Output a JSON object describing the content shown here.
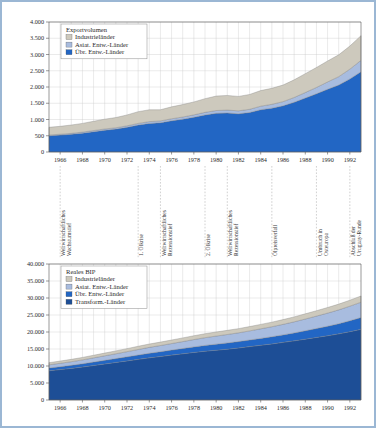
{
  "figure": {
    "background_color": "#ffffff",
    "frame_color": "#9bb7d4"
  },
  "palette": {
    "industrielaender": "#cdc9bd",
    "asiat_entw": "#a8bcdf",
    "uebr_entw": "#2266c4",
    "transform": "#1d4e96",
    "grid": "#c9c9c9",
    "axis": "#555555",
    "event_line": "#a9a9a9"
  },
  "chart_data": [
    {
      "id": "exportvolumen",
      "type": "area",
      "stacked": true,
      "title": "Exportvolumen",
      "xlabel": "",
      "ylabel": "",
      "grid": true,
      "legend_position": "top-left",
      "xlim": [
        1965,
        1993
      ],
      "ylim": [
        0,
        4000
      ],
      "ytick_labels": [
        "0",
        "500",
        "1.000",
        "1.500",
        "2.000",
        "2.500",
        "3.000",
        "3.500",
        "4.000"
      ],
      "ytick_values": [
        0,
        500,
        1000,
        1500,
        2000,
        2500,
        3000,
        3500,
        4000
      ],
      "xtick_labels": [
        "1966",
        "1968",
        "1970",
        "1972",
        "1974",
        "1976",
        "1978",
        "1980",
        "1982",
        "1984",
        "1986",
        "1988",
        "1990",
        "1992"
      ],
      "xtick_values": [
        1966,
        1968,
        1970,
        1972,
        1974,
        1976,
        1978,
        1980,
        1982,
        1984,
        1986,
        1988,
        1990,
        1992
      ],
      "x": [
        1965,
        1966,
        1967,
        1968,
        1969,
        1970,
        1971,
        1972,
        1973,
        1974,
        1975,
        1976,
        1977,
        1978,
        1979,
        1980,
        1981,
        1982,
        1983,
        1984,
        1985,
        1986,
        1987,
        1988,
        1989,
        1990,
        1991,
        1992,
        1993
      ],
      "series": [
        {
          "name": "Übr. Entw.-Länder",
          "color": "#2266c4",
          "values": [
            500,
            520,
            545,
            580,
            625,
            670,
            705,
            760,
            830,
            880,
            900,
            960,
            1010,
            1070,
            1140,
            1190,
            1200,
            1175,
            1215,
            1300,
            1350,
            1420,
            1530,
            1660,
            1790,
            1930,
            2060,
            2250,
            2470
          ]
        },
        {
          "name": "Asiat. Entw.-Länder",
          "color": "#a8bcdf",
          "values": [
            25,
            27,
            29,
            32,
            35,
            38,
            41,
            45,
            50,
            55,
            57,
            62,
            67,
            73,
            80,
            86,
            90,
            92,
            99,
            110,
            118,
            130,
            148,
            170,
            196,
            225,
            258,
            300,
            350
          ]
        },
        {
          "name": "Industrieländer",
          "color": "#cdc9bd",
          "values": [
            235,
            243,
            256,
            268,
            285,
            302,
            314,
            335,
            360,
            365,
            343,
            368,
            383,
            397,
            420,
            445,
            450,
            443,
            456,
            480,
            492,
            510,
            542,
            580,
            614,
            645,
            672,
            710,
            760
          ]
        }
      ],
      "series_order_stacked_bottom_to_top": [
        "Übr. Entw.-Länder",
        "Asiat. Entw.-Länder",
        "Industrieländer"
      ],
      "legend_entries": [
        {
          "label": "Industrieländer",
          "color": "#cdc9bd"
        },
        {
          "label": "Asiat. Entw.-Länder",
          "color": "#a8bcdf"
        },
        {
          "label": "Übr. Entw.-Länder",
          "color": "#2266c4"
        }
      ]
    },
    {
      "id": "reales-bip",
      "type": "area",
      "stacked": true,
      "title": "Reales BIP",
      "xlabel": "",
      "ylabel": "",
      "grid": true,
      "legend_position": "top-left",
      "xlim": [
        1965,
        1993
      ],
      "ylim": [
        0,
        40000
      ],
      "ytick_labels": [
        "0",
        "5.000",
        "10.000",
        "15.000",
        "20.000",
        "25.000",
        "30.000",
        "35.000",
        "40.000"
      ],
      "ytick_values": [
        0,
        5000,
        10000,
        15000,
        20000,
        25000,
        30000,
        35000,
        40000
      ],
      "xtick_labels": [
        "1966",
        "1968",
        "1970",
        "1972",
        "1974",
        "1976",
        "1978",
        "1980",
        "1982",
        "1984",
        "1986",
        "1988",
        "1990",
        "1992"
      ],
      "xtick_values": [
        1966,
        1968,
        1970,
        1972,
        1974,
        1976,
        1978,
        1980,
        1982,
        1984,
        1986,
        1988,
        1990,
        1992
      ],
      "x": [
        1965,
        1966,
        1967,
        1968,
        1969,
        1970,
        1971,
        1972,
        1973,
        1974,
        1975,
        1976,
        1977,
        1978,
        1979,
        1980,
        1981,
        1982,
        1983,
        1984,
        1985,
        1986,
        1987,
        1988,
        1989,
        1990,
        1991,
        1992,
        1993
      ],
      "series": [
        {
          "name": "Transform.-Länder",
          "color": "#1d4e96",
          "values": [
            8600,
            8950,
            9300,
            9700,
            10150,
            10600,
            11050,
            11500,
            11950,
            12400,
            12800,
            13200,
            13600,
            14000,
            14350,
            14650,
            14950,
            15300,
            15700,
            16100,
            16500,
            16950,
            17400,
            17900,
            18400,
            18900,
            19450,
            20100,
            20800
          ]
        },
        {
          "name": "Übr. Entw.-Länder",
          "color": "#2266c4",
          "values": [
            800,
            840,
            890,
            940,
            1000,
            1060,
            1120,
            1190,
            1270,
            1340,
            1400,
            1470,
            1540,
            1620,
            1700,
            1770,
            1830,
            1880,
            1940,
            2020,
            2100,
            2200,
            2320,
            2460,
            2620,
            2790,
            2980,
            3200,
            3450
          ]
        },
        {
          "name": "Asiat. Entw.-Länder",
          "color": "#a8bcdf",
          "values": [
            950,
            1010,
            1080,
            1160,
            1250,
            1340,
            1430,
            1530,
            1640,
            1740,
            1830,
            1930,
            2040,
            2160,
            2280,
            2390,
            2490,
            2580,
            2690,
            2820,
            2950,
            3100,
            3270,
            3460,
            3660,
            3870,
            4080,
            4300,
            4520
          ]
        },
        {
          "name": "Industrieländer",
          "color": "#cdc9bd",
          "values": [
            620,
            650,
            680,
            720,
            760,
            800,
            840,
            890,
            940,
            980,
            1000,
            1040,
            1080,
            1120,
            1160,
            1190,
            1210,
            1230,
            1260,
            1300,
            1340,
            1390,
            1450,
            1520,
            1580,
            1640,
            1690,
            1750,
            1820
          ]
        }
      ],
      "series_order_stacked_bottom_to_top": [
        "Transform.-Länder",
        "Übr. Entw.-Länder",
        "Asiat. Entw.-Länder",
        "Industrieländer"
      ],
      "legend_entries": [
        {
          "label": "Industrieländer",
          "color": "#cdc9bd"
        },
        {
          "label": "Asiat. Entw.-Länder",
          "color": "#a8bcdf"
        },
        {
          "label": "Übr. Entw.-Länder",
          "color": "#2266c4"
        },
        {
          "label": "Transform.-Länder",
          "color": "#1d4e96"
        }
      ]
    }
  ],
  "timeline": {
    "events": [
      {
        "year": 1966,
        "label_line1": "Weltwirtschaftliches",
        "label_line2": "Wachstumstief"
      },
      {
        "year": 1973,
        "label_line1": "1. Ölkrise",
        "label_line2": ""
      },
      {
        "year": 1975,
        "label_line1": "Weltwirtschaftliches",
        "label_line2": "Rezessionstief"
      },
      {
        "year": 1979,
        "label_line1": "2. Ölkrise",
        "label_line2": ""
      },
      {
        "year": 1981,
        "label_line1": "Weltwirtschaftliches",
        "label_line2": "Rezessionstief"
      },
      {
        "year": 1985,
        "label_line1": "Ölpreisverfall",
        "label_line2": ""
      },
      {
        "year": 1989,
        "label_line1": "Umbruch in",
        "label_line2": "Osteuropa"
      },
      {
        "year": 1992,
        "label_line1": "Abschluß der",
        "label_line2": "Uruguay-Runde"
      }
    ]
  }
}
